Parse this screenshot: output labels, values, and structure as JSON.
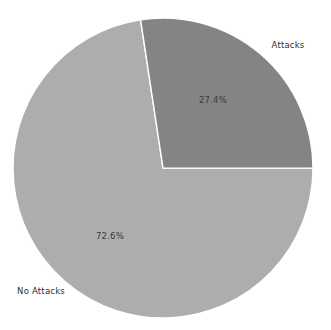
{
  "chart_data": {
    "type": "pie",
    "title": "",
    "subtitle": "",
    "xlabel": "",
    "ylabel": "",
    "grid": false,
    "legend_position": "none",
    "labels_outside": true,
    "start_angle_deg": -8.6,
    "direction": "clockwise",
    "categories": [
      "Attacks",
      "No Attacks"
    ],
    "values": [
      27.4,
      72.6
    ],
    "value_unit": "percent",
    "slices": [
      {
        "label": "Attacks",
        "percent_text": "27.4%",
        "percent_value": 27.4,
        "color": "#848484"
      },
      {
        "label": "No Attacks",
        "percent_text": "72.6%",
        "percent_value": 72.6,
        "color": "#adadad"
      }
    ]
  },
  "figure": {
    "background_color": "#ffffff",
    "label_text_color": "#2f2f2f",
    "percent_text_color": "#3a3a3a",
    "wedge_edge_color": "#ffffff"
  }
}
